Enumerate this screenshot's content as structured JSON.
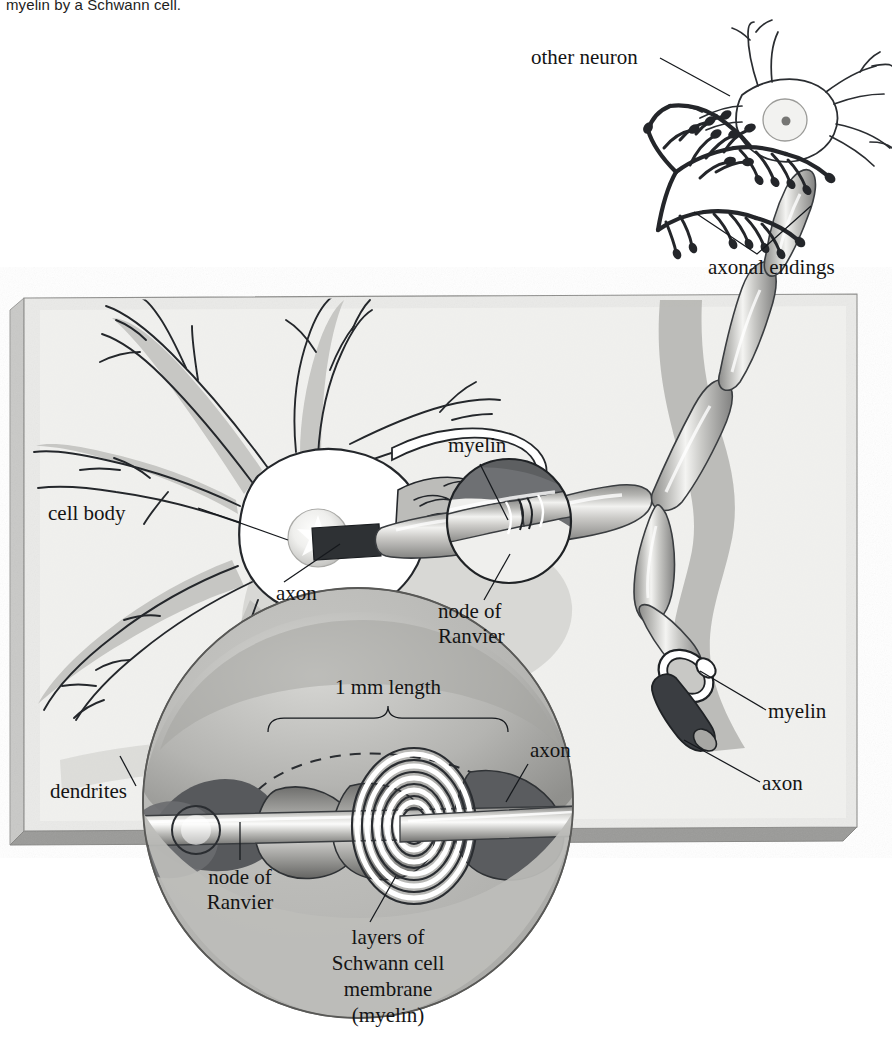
{
  "figure": {
    "caption_top": "myelin by a Schwann cell.",
    "background_color": "#ffffff",
    "panel": {
      "face_color": "#e9e9e7",
      "edge_left_color": "#c6c6c4",
      "edge_bottom_color": "#8f8f8d",
      "outline_color": "#8a8a88"
    },
    "ink_color": "#141414"
  },
  "labels": {
    "other_neuron": "other neuron",
    "axonal_endings": "axonal endings",
    "cell_body": "cell body",
    "dendrites": "dendrites",
    "axon_soma": "axon",
    "myelin_mid": "myelin",
    "node_of_ranvier_mid_line1": "node of",
    "node_of_ranvier_mid_line2": "Ranvier",
    "myelin_right": "myelin",
    "axon_right": "axon"
  },
  "inset": {
    "scale_label": "1 mm length",
    "axon_label": "axon",
    "node_line1": "node of",
    "node_line2": "Ranvier",
    "membrane_line1": "layers of",
    "membrane_line2": "Schwann cell",
    "membrane_line3": "membrane",
    "membrane_line4": "(myelin)"
  },
  "diagram_data": {
    "type": "biological-illustration",
    "subject": "Myelinated neuron and Schwann cell myelin sheath",
    "scale_annotation": "1 mm length",
    "structures": [
      "cell body",
      "dendrites",
      "axon",
      "myelin",
      "node of Ranvier",
      "axonal endings",
      "other neuron",
      "layers of Schwann cell membrane (myelin)"
    ],
    "myelin_segment_count": 7,
    "myelin_spiral_turns": 6
  }
}
